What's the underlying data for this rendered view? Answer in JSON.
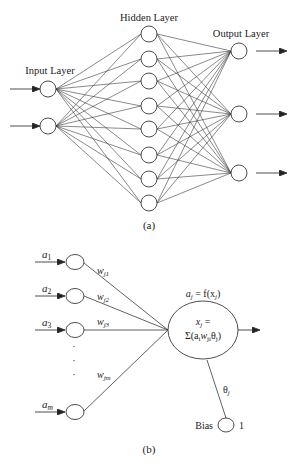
{
  "figure_a": {
    "caption": "(a)",
    "input_layer_label": "Input Layer",
    "hidden_layer_label": "Hidden Layer",
    "output_layer_label": "Output Layer",
    "input_nodes": 2,
    "hidden_nodes": 8,
    "output_nodes": 3
  },
  "figure_b": {
    "caption": "(b)",
    "inputs": [
      "a",
      "a",
      "a",
      "a"
    ],
    "input_subscripts": [
      "1",
      "2",
      "3",
      "m"
    ],
    "weights": [
      "w",
      "w",
      "w",
      "w"
    ],
    "weight_subscripts": [
      "j1",
      "j2",
      "j3",
      "jm"
    ],
    "neuron_top_label": "a",
    "neuron_top_sub": "j",
    "neuron_top_eq": " = f(x",
    "neuron_top_sub2": "j",
    "neuron_top_end": ")",
    "neuron_line1_var": "x",
    "neuron_line1_sub": "j",
    "neuron_line1_eq": " =",
    "neuron_line2": "Σ(a",
    "neuron_line2_sub1": "i",
    "neuron_line2_w": "w",
    "neuron_line2_sub2": "ji",
    "neuron_line2_theta": "θ",
    "neuron_line2_sub3": "j",
    "neuron_line2_end": ")",
    "bias_weight": "θ",
    "bias_weight_sub": "j",
    "bias_label": "Bias",
    "bias_value": "1",
    "ellipsis": "·"
  }
}
